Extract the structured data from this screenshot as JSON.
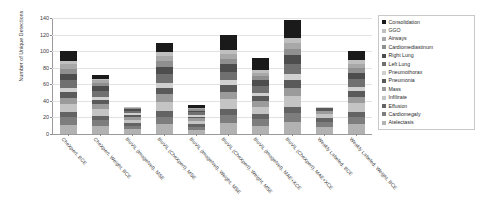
{
  "chart_data": {
    "type": "bar",
    "subtype": "stacked-bar",
    "title": "",
    "xlabel": "",
    "ylabel": "Number of Unique Detections",
    "ylim": [
      0,
      140
    ],
    "yticks": [
      0,
      20,
      40,
      60,
      80,
      100,
      120,
      140
    ],
    "grid": true,
    "legend_position": "right",
    "legend_entries": [
      "Consolidation",
      "GGO",
      "Airways",
      "Cardiomediastinum",
      "Right Lung",
      "Left Lung",
      "Pneumothorax",
      "Pneumonia",
      "Mass",
      "Infiltrate",
      "Effusion",
      "Cardiomegaly",
      "Atelectasis"
    ],
    "legend_colors": [
      "#1a1a1a",
      "#bfbfbf",
      "#a8a8a8",
      "#8f8f8f",
      "#4d4d4d",
      "#707070",
      "#d0d0d0",
      "#5a5a5a",
      "#9b9b9b",
      "#c4c4c4",
      "#636363",
      "#7d7d7d",
      "#b2b2b2"
    ],
    "categories": [
      "CheXpert, BCE",
      "CheXpert, Weight, BCE",
      "BioViL (ImageNet), MSE",
      "BioViL (CheXpert), MSE",
      "BioViL (ImageNet), Weight, MSE",
      "BioViL (CheXpert), Weight, MSE",
      "BioViL (ImageNet), MAE+XCE",
      "BioViL (CheXpert), MAE+XCE",
      "Weakly Labeled, BCE",
      "Weakly Labeled, Weight, BCE"
    ],
    "series": [
      {
        "name": "Atelectasis",
        "values": [
          11,
          10,
          6,
          12,
          5,
          13,
          10,
          14,
          8,
          12
        ]
      },
      {
        "name": "Cardiomegaly",
        "values": [
          9,
          7,
          4,
          9,
          4,
          10,
          8,
          11,
          6,
          9
        ]
      },
      {
        "name": "Effusion",
        "values": [
          6,
          5,
          3,
          7,
          3,
          7,
          6,
          8,
          5,
          6
        ]
      },
      {
        "name": "Infiltrate",
        "values": [
          10,
          8,
          4,
          11,
          4,
          12,
          9,
          13,
          5,
          10
        ]
      },
      {
        "name": "Mass",
        "values": [
          8,
          6,
          3,
          9,
          3,
          9,
          7,
          10,
          4,
          8
        ]
      },
      {
        "name": "Pneumonia",
        "values": [
          7,
          5,
          3,
          8,
          2,
          8,
          6,
          9,
          3,
          7
        ]
      },
      {
        "name": "Pneumothorax",
        "values": [
          5,
          4,
          2,
          6,
          2,
          6,
          4,
          7,
          2,
          5
        ]
      },
      {
        "name": "Left Lung",
        "values": [
          9,
          7,
          3,
          10,
          3,
          10,
          8,
          12,
          0,
          9
        ]
      },
      {
        "name": "Right Lung",
        "values": [
          8,
          6,
          2,
          9,
          2,
          9,
          7,
          11,
          0,
          8
        ]
      },
      {
        "name": "Cardiomediastinum",
        "values": [
          6,
          4,
          1,
          7,
          2,
          7,
          5,
          8,
          0,
          6
        ]
      },
      {
        "name": "Airways",
        "values": [
          5,
          3,
          1,
          6,
          1,
          6,
          4,
          7,
          0,
          5
        ]
      },
      {
        "name": "GGO",
        "values": [
          4,
          2,
          1,
          5,
          1,
          5,
          3,
          6,
          0,
          4
        ]
      },
      {
        "name": "Consolidation",
        "values": [
          12,
          4,
          0,
          11,
          3,
          18,
          15,
          22,
          0,
          11
        ]
      }
    ],
    "totals": [
      100,
      71,
      33,
      110,
      35,
      120,
      92,
      138,
      33,
      100
    ]
  },
  "legend": {
    "items": [
      {
        "label": "Consolidation",
        "color": "#1a1a1a"
      },
      {
        "label": "GGO",
        "color": "#bfbfbf"
      },
      {
        "label": "Airways",
        "color": "#a8a8a8"
      },
      {
        "label": "Cardiomediastinum",
        "color": "#8f8f8f"
      },
      {
        "label": "Right Lung",
        "color": "#4d4d4d"
      },
      {
        "label": "Left Lung",
        "color": "#707070"
      },
      {
        "label": "Pneumothorax",
        "color": "#d0d0d0"
      },
      {
        "label": "Pneumonia",
        "color": "#5a5a5a"
      },
      {
        "label": "Mass",
        "color": "#9b9b9b"
      },
      {
        "label": "Infiltrate",
        "color": "#c4c4c4"
      },
      {
        "label": "Effusion",
        "color": "#636363"
      },
      {
        "label": "Cardiomegaly",
        "color": "#7d7d7d"
      },
      {
        "label": "Atelectasis",
        "color": "#b2b2b2"
      }
    ]
  }
}
